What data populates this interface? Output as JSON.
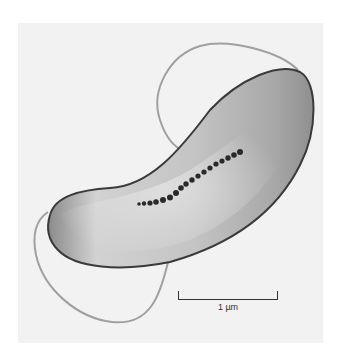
{
  "figure": {
    "scale_bar": {
      "label": "1 µm"
    }
  },
  "colors": {
    "background": "#f2f2f2",
    "cell_body": "#b8b8b8",
    "cell_edge": "#3a3a3a",
    "granules": "#2a2a2a",
    "flagella": "#9a9a9a"
  }
}
